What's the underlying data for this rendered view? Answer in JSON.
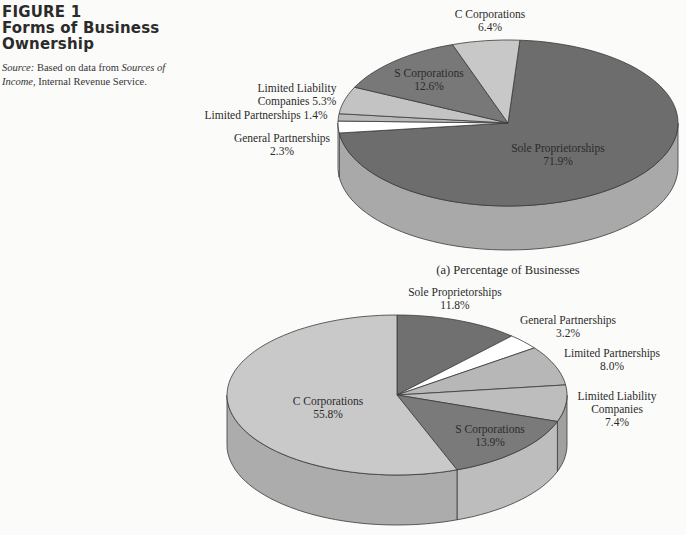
{
  "figure": {
    "label": "FIGURE 1",
    "title": "Forms of Business Ownership",
    "source_prefix": "Source:",
    "source_text_1": " Based on data from ",
    "source_italic": "Sources of Income",
    "source_text_2": ", Internal Revenue Service."
  },
  "chart_data": [
    {
      "type": "pie",
      "title": "(a) Percentage of Businesses",
      "three_d": true,
      "start_angle_deg": 4,
      "direction": "clockwise",
      "geometry": {
        "cx": 508,
        "cy": 123,
        "rx": 170,
        "ry": 83,
        "depth": 44
      },
      "slices": [
        {
          "name": "Sole Proprietorships",
          "value": 71.9,
          "color": "#6d6d6d",
          "side": "#a9a9a9",
          "label_lines": [
            "Sole Proprietorships",
            "71.9%"
          ],
          "label_pos": [
            558,
            152
          ]
        },
        {
          "name": "General Partnerships",
          "value": 2.3,
          "color": "#ffffff",
          "side": "#f2f2f2",
          "label_lines": [
            "General Partnerships",
            "2.3%"
          ],
          "label_pos": [
            282,
            142
          ],
          "outside": true
        },
        {
          "name": "Limited Partnerships",
          "value": 1.4,
          "color": "#b9b9b9",
          "side": "#b0b0b0",
          "label_lines": [
            "Limited Partnerships 1.4%"
          ],
          "label_pos": [
            266,
            119
          ],
          "outside": true
        },
        {
          "name": "Limited Liability Companies",
          "value": 5.3,
          "color": "#c3c3c3",
          "side": "#b5b5b5",
          "label_lines": [
            "Limited Liability",
            "Companies 5.3%"
          ],
          "label_pos": [
            297,
            92
          ],
          "outside": true
        },
        {
          "name": "S Corporations",
          "value": 12.6,
          "color": "#787878",
          "side": "#9a9a9a",
          "label_lines": [
            "S Corporations",
            "12.6%"
          ],
          "label_pos": [
            429,
            77
          ]
        },
        {
          "name": "C Corporations",
          "value": 6.4,
          "color": "#c8c8c8",
          "side": "#b8b8b8",
          "label_lines": [
            "C Corporations",
            "6.4%"
          ],
          "label_pos": [
            490,
            18
          ],
          "outside": true
        }
      ]
    },
    {
      "type": "pie",
      "title": "(b) Percentage of Revenues",
      "three_d": true,
      "start_angle_deg": 0,
      "direction": "clockwise",
      "geometry": {
        "cx": 397,
        "cy": 395,
        "rx": 170,
        "ry": 80,
        "depth": 50
      },
      "slices": [
        {
          "name": "Sole Proprietorships",
          "value": 11.8,
          "color": "#707070",
          "side": "#9c9c9c",
          "label_lines": [
            "Sole Proprietorships",
            "11.8%"
          ],
          "label_pos": [
            455,
            296
          ],
          "outside": true
        },
        {
          "name": "General Partnerships",
          "value": 3.2,
          "color": "#ffffff",
          "side": "#f2f2f2",
          "label_lines": [
            "General Partnerships",
            "3.2%"
          ],
          "label_pos": [
            568,
            324
          ],
          "outside": true
        },
        {
          "name": "Limited Partnerships",
          "value": 8.0,
          "color": "#b7b7b7",
          "side": "#a8a8a8",
          "label_lines": [
            "Limited Partnerships",
            "8.0%"
          ],
          "label_pos": [
            612,
            357
          ],
          "outside": true
        },
        {
          "name": "Limited Liability Companies",
          "value": 7.4,
          "color": "#bdbdbd",
          "side": "#a0a0a0",
          "label_lines": [
            "Limited Liability",
            "Companies",
            "7.4%"
          ],
          "label_pos": [
            617,
            400
          ],
          "outside": true
        },
        {
          "name": "S Corporations",
          "value": 13.9,
          "color": "#7a7a7a",
          "side": "#bdbdbd",
          "label_lines": [
            "S Corporations",
            "13.9%"
          ],
          "label_pos": [
            490,
            433
          ]
        },
        {
          "name": "C Corporations",
          "value": 55.8,
          "color": "#c9c9c9",
          "side": "#acacac",
          "label_lines": [
            "C Corporations",
            "55.8%"
          ],
          "label_pos": [
            328,
            405
          ]
        }
      ]
    }
  ],
  "captions": {
    "a": "(a) Percentage of Businesses"
  }
}
